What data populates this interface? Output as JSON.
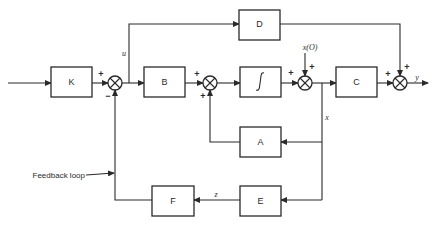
{
  "diagram": {
    "type": "control-system-block-diagram",
    "blocks": {
      "K": "K",
      "B": "B",
      "integrator": "∫",
      "C": "C",
      "D": "D",
      "A": "A",
      "E": "E",
      "F": "F"
    },
    "signals": {
      "u": "u",
      "x": "x",
      "x0": "x(O)",
      "y": "y",
      "z": "z"
    },
    "signs": {
      "sum1_top": "+",
      "sum1_bottom": "−",
      "sum2_left": "+",
      "sum2_bottom": "+",
      "sum3_left": "+",
      "sum3_top": "+",
      "sum4_left": "+",
      "sum4_top": "+"
    },
    "annotations": {
      "feedback": "Feedback loop"
    },
    "colors": {
      "line": "#2a2a2a",
      "background": "#ffffff"
    }
  }
}
